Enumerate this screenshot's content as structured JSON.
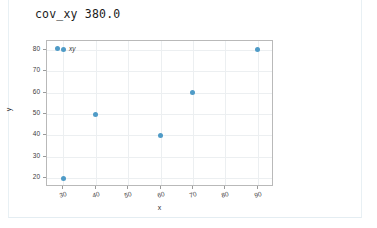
{
  "output": {
    "text": "cov_xy 380.0"
  },
  "chart_data": {
    "type": "scatter",
    "title": "",
    "xlabel": "x",
    "ylabel": "y",
    "xlim": [
      25,
      95
    ],
    "ylim": [
      16,
      84
    ],
    "xticks": [
      30,
      40,
      50,
      60,
      70,
      80,
      90
    ],
    "yticks": [
      20,
      30,
      40,
      50,
      60,
      70,
      80
    ],
    "grid": true,
    "legend": {
      "position": "upper-left-inside",
      "entries": [
        {
          "name": "xy",
          "color": "#4f9bc7",
          "marker": "circle"
        }
      ]
    },
    "series": [
      {
        "name": "xy",
        "color": "#4f9bc7",
        "points": [
          {
            "x": 30,
            "y": 80
          },
          {
            "x": 30,
            "y": 20
          },
          {
            "x": 40,
            "y": 50
          },
          {
            "x": 60,
            "y": 40
          },
          {
            "x": 70,
            "y": 60
          },
          {
            "x": 90,
            "y": 80
          }
        ]
      }
    ]
  },
  "colors": {
    "marker": "#4f9bc7",
    "grid": "#eceff1",
    "frame": "#b9b9b9",
    "card_border": "#e8f0f4"
  }
}
